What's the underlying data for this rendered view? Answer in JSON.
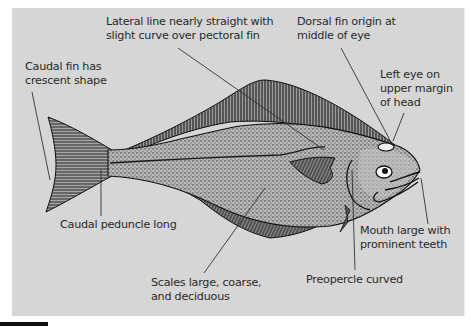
{
  "figure": {
    "background_color": "#d6d6d6",
    "text_color": "#2a2a2a",
    "labels": [
      {
        "id": "lateral-line",
        "line1": "Lateral line nearly straight with",
        "line2": "slight curve over pectoral fin"
      },
      {
        "id": "dorsal-fin-origin",
        "line1": "Dorsal fin origin at",
        "line2": "middle of eye"
      },
      {
        "id": "caudal-fin",
        "line1": "Caudal fin has",
        "line2": "crescent shape"
      },
      {
        "id": "left-eye",
        "line1": "Left eye on",
        "line2": "upper margin",
        "line3": "of head"
      },
      {
        "id": "caudal-peduncle",
        "line1": "Caudal peduncle long"
      },
      {
        "id": "mouth",
        "line1": "Mouth large with",
        "line2": "prominent teeth"
      },
      {
        "id": "scales",
        "line1": "Scales large, coarse,",
        "line2": "and deciduous"
      },
      {
        "id": "preopercle",
        "line1": "Preopercle curved"
      }
    ]
  }
}
